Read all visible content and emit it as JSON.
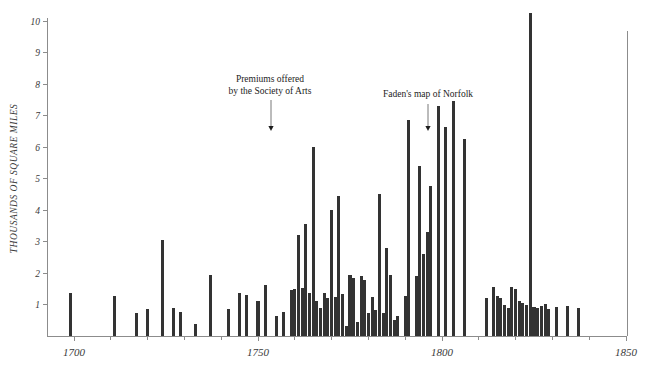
{
  "chart_data": {
    "type": "bar",
    "title": "",
    "subtitle": "",
    "xlabel": "",
    "ylabel": "THOUSANDS  OF  SQUARE  MILES",
    "xlim": [
      1692,
      1853
    ],
    "ylim": [
      0,
      10.4
    ],
    "grid": false,
    "legend": null,
    "xticks_major": [
      1700,
      1750,
      1800,
      1850
    ],
    "xtick_labels": [
      "1700",
      "1750",
      "1800",
      "1850"
    ],
    "xticks_minor": [
      1710,
      1720,
      1730,
      1740,
      1760,
      1770,
      1780,
      1790,
      1810,
      1820,
      1830,
      1840
    ],
    "yticks": [
      1,
      2,
      3,
      4,
      5,
      6,
      7,
      8,
      9,
      10
    ],
    "ytick_labels": [
      "1",
      "2",
      "3",
      "4",
      "5",
      "6",
      "7",
      "8",
      "9",
      "10"
    ],
    "bar_color": "#333333",
    "axis_color": "#8c8c8c",
    "bar_width_years": 1.0,
    "x": [
      1699,
      1711,
      1717,
      1720,
      1724,
      1727,
      1729,
      1733,
      1737,
      1742,
      1745,
      1747,
      1750,
      1752,
      1755,
      1757,
      1759,
      1760,
      1761,
      1762,
      1763,
      1764,
      1765,
      1766,
      1767,
      1768,
      1769,
      1770,
      1771,
      1772,
      1773,
      1774,
      1775,
      1776,
      1777,
      1778,
      1779,
      1780,
      1781,
      1782,
      1783,
      1784,
      1785,
      1786,
      1787,
      1788,
      1790,
      1791,
      1793,
      1794,
      1795,
      1796,
      1797,
      1799,
      1801,
      1803,
      1806,
      1812,
      1814,
      1815,
      1816,
      1817,
      1818,
      1819,
      1820,
      1821,
      1822,
      1823,
      1824,
      1825,
      1826,
      1827,
      1828,
      1829,
      1831,
      1834,
      1837
    ],
    "values": [
      1.35,
      1.28,
      0.72,
      0.85,
      3.05,
      0.88,
      0.77,
      0.37,
      1.95,
      0.85,
      1.35,
      1.3,
      1.12,
      1.62,
      0.62,
      0.75,
      1.45,
      1.48,
      3.2,
      1.52,
      3.55,
      1.35,
      6.0,
      1.12,
      0.88,
      1.35,
      1.22,
      4.0,
      1.25,
      4.45,
      1.32,
      0.32,
      1.95,
      1.85,
      0.45,
      1.9,
      1.78,
      0.72,
      1.25,
      0.82,
      4.5,
      0.72,
      2.8,
      1.95,
      0.5,
      0.62,
      1.28,
      6.85,
      1.9,
      5.4,
      2.6,
      3.3,
      4.75,
      7.3,
      6.65,
      7.45,
      6.25,
      1.2,
      1.55,
      1.28,
      1.2,
      1.0,
      0.9,
      1.55,
      1.48,
      1.12,
      1.05,
      0.98,
      10.25,
      0.92,
      0.88,
      0.95,
      1.02,
      0.85,
      0.92,
      0.95,
      0.88
    ],
    "annotations": [
      {
        "name": "premiums-annotation",
        "lines": [
          "Premiums offered",
          "by the Society of Arts"
        ],
        "year": 1753.5,
        "text_x": 270,
        "text_y": 82,
        "arrow_x": 271,
        "arrow_top": 100,
        "arrow_bottom": 131
      },
      {
        "name": "faden-annotation",
        "lines": [
          "Faden's map of Norfolk"
        ],
        "year": 1796,
        "text_x": 428,
        "text_y": 97,
        "arrow_x": 428,
        "arrow_top": 104,
        "arrow_bottom": 131
      }
    ]
  },
  "geometry": {
    "origin_x": 47,
    "baseline_y": 336,
    "top_y": 21,
    "x_1700": 74,
    "x_1850": 626,
    "px_per_year": 3.68,
    "px_per_unit": 31.5,
    "right_edge_x": 626
  }
}
